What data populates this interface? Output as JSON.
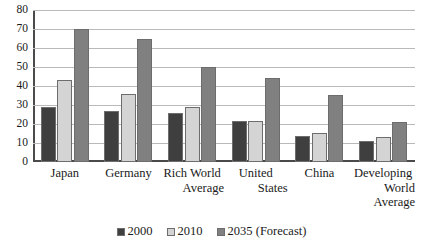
{
  "chart_data": {
    "type": "bar",
    "title": "",
    "subtitle": "",
    "xlabel": "",
    "ylabel": "",
    "ylim": [
      0,
      80
    ],
    "ytick_step": 10,
    "yticks": [
      80,
      70,
      60,
      50,
      40,
      30,
      20,
      10,
      0
    ],
    "grid": true,
    "legend_position": "bottom",
    "categories": [
      "Japan",
      "Germany",
      "Rich World Average",
      "United States",
      "China",
      "Developing World Average"
    ],
    "category_lines": [
      [
        "Japan"
      ],
      [
        "Germany"
      ],
      [
        "Rich World",
        "Average"
      ],
      [
        "United",
        "States"
      ],
      [
        "China"
      ],
      [
        "Developing",
        "World",
        "Average"
      ]
    ],
    "series": [
      {
        "name": "2000",
        "color": "#3f3f3f",
        "values": [
          29,
          27,
          26,
          21.5,
          13.5,
          11
        ]
      },
      {
        "name": "2010",
        "color": "#d4d4d4",
        "values": [
          43,
          36,
          29,
          21.5,
          15.5,
          13
        ]
      },
      {
        "name": "2035 (Forecast)",
        "color": "#808080",
        "values": [
          70,
          65,
          50,
          44,
          35.5,
          21
        ]
      }
    ]
  },
  "legend": {
    "items": [
      {
        "label": "2000",
        "color": "#3f3f3f"
      },
      {
        "label": "2010",
        "color": "#d4d4d4"
      },
      {
        "label": "2035 (Forecast)",
        "color": "#808080"
      }
    ]
  }
}
